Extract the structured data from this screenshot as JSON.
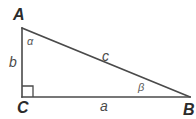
{
  "figure": {
    "name": "right-triangle-labeled",
    "background_color": "#ffffff",
    "stroke_color": "#4a4a4a",
    "stroke_width": 1.6,
    "geometry": {
      "vertex_A": {
        "x": 22,
        "y": 28
      },
      "vertex_B": {
        "x": 190,
        "y": 97
      },
      "vertex_C": {
        "x": 22,
        "y": 97
      },
      "right_angle_marker": {
        "x": 22,
        "y": 86,
        "size": 11
      }
    },
    "vertices": [
      {
        "id": "A",
        "label": "A"
      },
      {
        "id": "B",
        "label": "B"
      },
      {
        "id": "C",
        "label": "C"
      }
    ],
    "sides": [
      {
        "id": "a",
        "label": "a",
        "between": "C-B"
      },
      {
        "id": "b",
        "label": "b",
        "between": "A-C"
      },
      {
        "id": "c",
        "label": "c",
        "between": "A-B"
      }
    ],
    "angles": [
      {
        "id": "alpha",
        "label": "α",
        "at_vertex": "A"
      },
      {
        "id": "beta",
        "label": "β",
        "at_vertex": "B"
      }
    ]
  }
}
